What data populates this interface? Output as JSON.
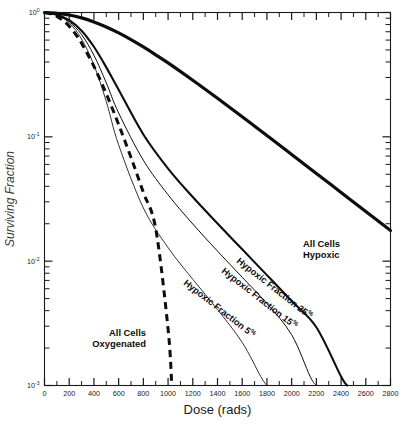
{
  "chart_data": {
    "type": "line",
    "title": "",
    "xlabel": "Dose (rads)",
    "ylabel": "Surviving Fraction",
    "xlim": [
      0,
      2800
    ],
    "ylim": [
      0.001,
      1
    ],
    "yscale": "log",
    "xscale": "linear",
    "grid": false,
    "legend_position": "inline-annotations",
    "xticks": [
      0,
      100,
      200,
      300,
      400,
      500,
      600,
      700,
      800,
      900,
      1000,
      1100,
      1200,
      1300,
      1400,
      1500,
      1600,
      1700,
      1800,
      1900,
      2000,
      2100,
      2200,
      2300,
      2400,
      2500,
      2600,
      2700,
      2800
    ],
    "xticklabels": [
      "0",
      "200",
      "400",
      "600",
      "800",
      "1000",
      "1200",
      "1400",
      "1600",
      "1800",
      "2000",
      "2200",
      "2400",
      "2600",
      "2800"
    ],
    "xticklabel_values": [
      0,
      200,
      400,
      600,
      800,
      1000,
      1200,
      1400,
      1600,
      1800,
      2000,
      2200,
      2400,
      2600,
      2800
    ],
    "yticklabels": [
      {
        "base": "10",
        "exponent": "0",
        "value": 1
      },
      {
        "base": "10",
        "exponent": "-1",
        "value": 0.1
      },
      {
        "base": "10",
        "exponent": "-2",
        "value": 0.01
      },
      {
        "base": "10",
        "exponent": "-3",
        "value": 0.001
      }
    ],
    "series": [
      {
        "name": "All Cells Hypoxic",
        "label": "All Cells\nHypoxic",
        "label_line1": "All Cells",
        "label_line2": "Hypoxic",
        "style": "thick",
        "dashed": false,
        "color": "#0d0d0d",
        "x": [
          0,
          100,
          200,
          300,
          400,
          500,
          600,
          700,
          800,
          900,
          1000,
          1200,
          1400,
          1600,
          1800,
          2000,
          2200,
          2400,
          2600,
          2800
        ],
        "y": [
          1.0,
          0.985,
          0.955,
          0.905,
          0.84,
          0.765,
          0.685,
          0.605,
          0.528,
          0.457,
          0.393,
          0.285,
          0.204,
          0.145,
          0.1025,
          0.0722,
          0.0508,
          0.0357,
          0.0251,
          0.01765
        ]
      },
      {
        "name": "Hypoxic Fraction 25%",
        "label": "Hypoxic Fraction 25%",
        "label_text": "Hypoxic Fraction 25",
        "label_sup": "%",
        "style": "medium",
        "dashed": false,
        "color": "#0d0d0d",
        "x": [
          0,
          100,
          200,
          300,
          400,
          500,
          600,
          800,
          1000,
          1200,
          1400,
          1600,
          1800,
          2000,
          2200,
          2400,
          2450
        ],
        "y": [
          1.0,
          0.96,
          0.868,
          0.714,
          0.53,
          0.362,
          0.239,
          0.1045,
          0.0556,
          0.0328,
          0.0201,
          0.01245,
          0.00772,
          0.00478,
          0.00294,
          0.00118,
          0.001
        ]
      },
      {
        "name": "Hypoxic Fraction 15%",
        "label": "Hypoxic Fraction 15%",
        "label_text": "Hypoxic Fraction 15",
        "label_sup": "%",
        "style": "thin",
        "dashed": false,
        "color": "#0d0d0d",
        "x": [
          0,
          100,
          200,
          300,
          400,
          500,
          600,
          800,
          1000,
          1200,
          1400,
          1600,
          1800,
          2000,
          2150,
          2200
        ],
        "y": [
          1.0,
          0.955,
          0.845,
          0.664,
          0.453,
          0.272,
          0.1555,
          0.0648,
          0.0342,
          0.0199,
          0.01205,
          0.00742,
          0.00456,
          0.00256,
          0.00118,
          0.001
        ]
      },
      {
        "name": "Hypoxic Fraction 5%",
        "label": "Hypoxic Fraction 5%",
        "label_text": "Hypoxic Fraction 5",
        "label_sup": "%",
        "style": "hairline",
        "dashed": false,
        "color": "#0d0d0d",
        "x": [
          0,
          100,
          200,
          300,
          400,
          500,
          600,
          800,
          1000,
          1200,
          1400,
          1600,
          1750,
          1800
        ],
        "y": [
          1.0,
          0.95,
          0.825,
          0.612,
          0.378,
          0.1925,
          0.0862,
          0.0268,
          0.01285,
          0.00715,
          0.00408,
          0.00222,
          0.00118,
          0.001
        ]
      },
      {
        "name": "All Cells Oxygenated",
        "label": "All Cells\nOxygenated",
        "label_line1": "All Cells",
        "label_line2": "Oxygenated",
        "style": "dashed",
        "dashed": true,
        "color": "#0d0d0d",
        "x": [
          0,
          50,
          100,
          150,
          200,
          250,
          300,
          400,
          500,
          600,
          700,
          800,
          900,
          1000,
          1030
        ],
        "y": [
          1.0,
          0.975,
          0.93,
          0.862,
          0.775,
          0.672,
          0.566,
          0.369,
          0.222,
          0.1255,
          0.0682,
          0.0357,
          0.01825,
          0.00285,
          0.001
        ]
      }
    ],
    "annotations": [
      {
        "text": "All Cells Hypoxic",
        "x": 2150,
        "y": 0.055,
        "rotation": 0
      },
      {
        "text": "Hypoxic Fraction 25%",
        "x": 1600,
        "y": 0.012,
        "rotation": 38
      },
      {
        "text": "Hypoxic Fraction 15%",
        "x": 1360,
        "y": 0.0098,
        "rotation": 38
      },
      {
        "text": "Hypoxic Fraction 5%",
        "x": 1060,
        "y": 0.0072,
        "rotation": 38
      },
      {
        "text": "All Cells Oxygenated",
        "x": 560,
        "y": 0.0068,
        "rotation": 0
      }
    ]
  },
  "figure": {
    "background": "#ffffff",
    "axis_color": "#1a1a1a",
    "curve_color": "#0d0d0d"
  }
}
